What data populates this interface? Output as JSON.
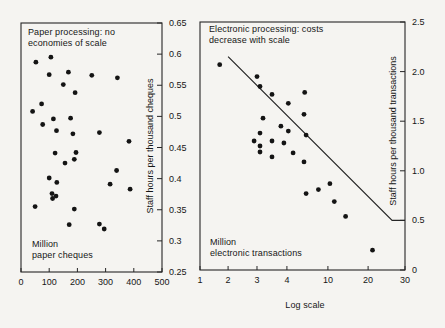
{
  "figure": {
    "background": "#f5f4f1",
    "ink": "#161616"
  },
  "chart_data": [
    {
      "type": "scatter",
      "title": "Paper processing: no economies of scale",
      "title_lines": [
        "Paper processing: no",
        "economies of scale"
      ],
      "corner_label_lines": [
        "Million",
        "paper cheques"
      ],
      "ylabel": "Staff hours per thousand cheques",
      "xlabel": "",
      "grid": false,
      "x_axis": {
        "scale": "linear",
        "min": 0,
        "max": 500,
        "ticks": [
          0,
          100,
          200,
          300,
          400,
          500
        ],
        "tick_labels": [
          "0",
          "100",
          "200",
          "300",
          "400",
          "500"
        ]
      },
      "y_axis": {
        "min": 0.25,
        "max": 0.65,
        "side": "right",
        "tick_labels": [
          "0.65",
          "0.6",
          "0.55",
          "0.5",
          "0.45",
          "0.4",
          "0.35",
          "0.3",
          "0.25"
        ]
      },
      "points": [
        [
          53,
          0.587
        ],
        [
          106,
          0.595
        ],
        [
          100,
          0.567
        ],
        [
          168,
          0.571
        ],
        [
          251,
          0.566
        ],
        [
          342,
          0.562
        ],
        [
          150,
          0.551
        ],
        [
          192,
          0.538
        ],
        [
          73,
          0.52
        ],
        [
          41,
          0.508
        ],
        [
          115,
          0.496
        ],
        [
          176,
          0.497
        ],
        [
          77,
          0.487
        ],
        [
          126,
          0.477
        ],
        [
          184,
          0.472
        ],
        [
          278,
          0.474
        ],
        [
          383,
          0.46
        ],
        [
          121,
          0.441
        ],
        [
          195,
          0.442
        ],
        [
          189,
          0.431
        ],
        [
          156,
          0.425
        ],
        [
          339,
          0.413
        ],
        [
          100,
          0.401
        ],
        [
          127,
          0.394
        ],
        [
          316,
          0.391
        ],
        [
          387,
          0.383
        ],
        [
          110,
          0.376
        ],
        [
          124,
          0.372
        ],
        [
          112,
          0.368
        ],
        [
          50,
          0.355
        ],
        [
          189,
          0.351
        ],
        [
          171,
          0.326
        ],
        [
          278,
          0.327
        ],
        [
          295,
          0.319
        ]
      ]
    },
    {
      "type": "scatter",
      "title": "Electronic processing: costs decrease with scale",
      "title_lines": [
        "Electronic processing: costs",
        "decrease with scale"
      ],
      "corner_label_lines": [
        "Million",
        "electronic transactions"
      ],
      "ylabel": "Staff hours per thousand transactions",
      "xlabel": "Log scale",
      "grid": false,
      "x_axis": {
        "scale": "log",
        "min": 1,
        "max": 30,
        "ticks": [
          1,
          2,
          3,
          4,
          10,
          20,
          30
        ],
        "tick_labels": [
          "1",
          "2",
          "3",
          "4",
          "10",
          "20",
          "30"
        ],
        "tick_fractions": [
          0,
          0.137,
          0.278,
          0.424,
          0.624,
          0.82,
          1.0
        ]
      },
      "y_axis": {
        "min": 0,
        "max": 2.5,
        "side": "right",
        "tick_labels": [
          "2.5",
          "2.0",
          "1.5",
          "1.0",
          "0.5",
          "0"
        ]
      },
      "points": [
        [
          1.7,
          2.07
        ],
        [
          3.0,
          1.95
        ],
        [
          3.1,
          1.85
        ],
        [
          3.5,
          1.77
        ],
        [
          6.6,
          1.79
        ],
        [
          4.2,
          1.68
        ],
        [
          6.5,
          1.57
        ],
        [
          3.2,
          1.53
        ],
        [
          3.8,
          1.45
        ],
        [
          4.2,
          1.4
        ],
        [
          3.1,
          1.38
        ],
        [
          6.8,
          1.36
        ],
        [
          2.9,
          1.3
        ],
        [
          3.5,
          1.3
        ],
        [
          3.1,
          1.25
        ],
        [
          3.9,
          1.28
        ],
        [
          3.1,
          1.19
        ],
        [
          3.5,
          1.14
        ],
        [
          4.9,
          1.18
        ],
        [
          6.5,
          1.09
        ],
        [
          6.8,
          0.77
        ],
        [
          8.6,
          0.81
        ],
        [
          10.5,
          0.87
        ],
        [
          11.6,
          0.69
        ],
        [
          14.4,
          0.54
        ],
        [
          21.2,
          0.2
        ]
      ],
      "trend_line": {
        "points": [
          [
            2.0,
            2.15
          ],
          [
            26.5,
            0.5
          ],
          [
            30,
            0.5
          ]
        ]
      }
    }
  ]
}
